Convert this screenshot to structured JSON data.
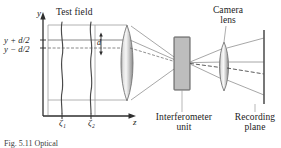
{
  "figure": {
    "type": "optical-schematic",
    "background_color": "#ffffff",
    "line_color": "#4a4a4a",
    "axis_color": "#3a3a3a",
    "accent_color": "#9a9a9a"
  },
  "axes": {
    "y_axis_label": "y",
    "z_axis_label": "z",
    "y_plus_label": "y + d/2",
    "y_minus_label": "y − d/2",
    "separation_label": "d",
    "tick_1_label": "ζ₁",
    "tick_2_label": "ζ₂"
  },
  "components": [
    {
      "id": "test-field",
      "label": "Test field",
      "shape": "wavy-wavefronts",
      "color": "#4a4a4a"
    },
    {
      "id": "objective-lens",
      "label": "",
      "shape": "biconvex-lens",
      "color": "#b0b0b0"
    },
    {
      "id": "interferometer-unit",
      "label": "Interferometer unit",
      "label_line_1": "Interferometer",
      "label_line_2": "unit",
      "shape": "rectangle-block",
      "fill_color": "#b8b8b8",
      "stroke_color": "#606060"
    },
    {
      "id": "camera-lens",
      "label": "Camera lens",
      "label_line_1": "Camera",
      "label_line_2": "lens",
      "shape": "biconvex-lens",
      "color": "#b0b0b0"
    },
    {
      "id": "recording-plane",
      "label": "Recording plane",
      "label_line_1": "Recording",
      "label_line_2": "plane",
      "shape": "vertical-line",
      "color": "#555555"
    }
  ],
  "caption": {
    "label": "Fig.",
    "text": "Fig. 5.11  Optical"
  }
}
